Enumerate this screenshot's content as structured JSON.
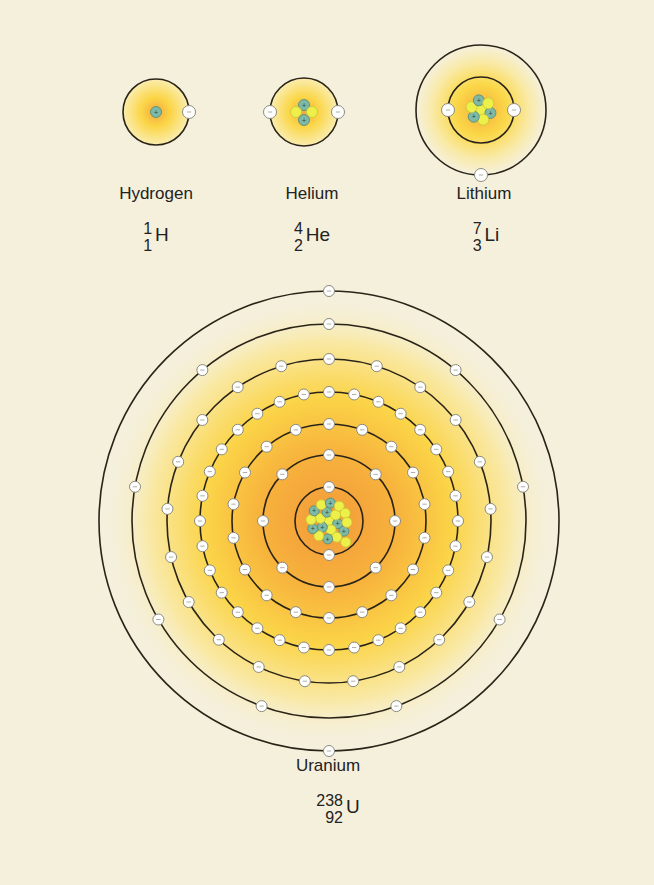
{
  "colors": {
    "background": "#f5f0dc",
    "orbit": "#2a2418",
    "glow_inner": "#f5a43a",
    "glow_mid": "#fbd84a",
    "proton": "#7fb8a4",
    "neutron": "#eef04a",
    "electron": "#ffffff"
  },
  "atoms": [
    {
      "name": "Hydrogen",
      "symbol": "H",
      "mass_number": "1",
      "atomic_number": "1",
      "center": [
        156,
        112
      ],
      "orbit_radii": [
        33
      ],
      "electrons_per_shell": [
        1
      ],
      "protons": 1,
      "neutrons": 0,
      "label_pos": [
        156,
        196
      ],
      "nuclide_pos": [
        156,
        232
      ]
    },
    {
      "name": "Helium",
      "symbol": "He",
      "mass_number": "4",
      "atomic_number": "2",
      "center": [
        304,
        112
      ],
      "orbit_radii": [
        34
      ],
      "electrons_per_shell": [
        2
      ],
      "protons": 2,
      "neutrons": 2,
      "label_pos": [
        312,
        196
      ],
      "nuclide_pos": [
        312,
        232
      ]
    },
    {
      "name": "Lithium",
      "symbol": "Li",
      "mass_number": "7",
      "atomic_number": "3",
      "center": [
        481,
        110
      ],
      "orbit_radii": [
        33,
        65
      ],
      "electrons_per_shell": [
        2,
        1
      ],
      "protons": 3,
      "neutrons": 4,
      "label_pos": [
        484,
        196
      ],
      "nuclide_pos": [
        486,
        232
      ]
    },
    {
      "name": "Uranium",
      "symbol": "U",
      "mass_number": "238",
      "atomic_number": "92",
      "center": [
        329,
        521
      ],
      "orbit_radii": [
        34,
        66,
        97,
        129,
        162,
        197,
        230
      ],
      "electrons_per_shell": [
        2,
        8,
        18,
        32,
        21,
        9,
        2
      ],
      "protons": 8,
      "neutrons": 12,
      "label_pos": [
        328,
        768
      ],
      "nuclide_pos": [
        338,
        804
      ]
    }
  ]
}
